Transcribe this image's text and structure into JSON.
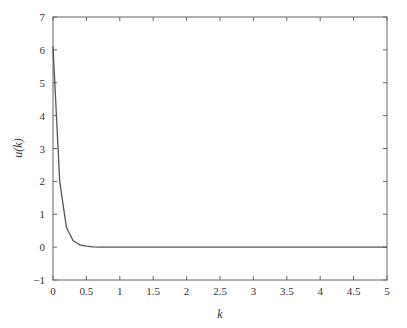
{
  "chart_data": {
    "type": "line",
    "title": "",
    "xlabel": "k",
    "ylabel": "u(k)",
    "xlim": [
      0,
      5
    ],
    "ylim": [
      -1,
      7
    ],
    "grid": false,
    "legend": null,
    "x_ticks": [
      0,
      0.5,
      1,
      1.5,
      2,
      2.5,
      3,
      3.5,
      4,
      4.5,
      5
    ],
    "x_tick_labels": [
      "0",
      "0.5",
      "1",
      "1.5",
      "2",
      "2.5",
      "3",
      "3.5",
      "4",
      "4.5",
      "5"
    ],
    "y_ticks": [
      -1,
      0,
      1,
      2,
      3,
      4,
      5,
      6,
      7
    ],
    "y_tick_labels": [
      "−1",
      "0",
      "1",
      "2",
      "3",
      "4",
      "5",
      "6",
      "7"
    ],
    "series": [
      {
        "name": "u(k)",
        "color": "#555555",
        "x": [
          0,
          0.1,
          0.2,
          0.3,
          0.4,
          0.5,
          0.6,
          0.7,
          0.8,
          1.0,
          1.5,
          2.0,
          2.5,
          3.0,
          3.5,
          4.0,
          4.5,
          5.0
        ],
        "values": [
          6.1,
          2.0,
          0.6,
          0.2,
          0.07,
          0.03,
          0.01,
          0.0,
          0.0,
          0.0,
          0.0,
          0.0,
          0.0,
          0.0,
          0.0,
          0.0,
          0.0,
          0.0
        ]
      }
    ]
  },
  "colors": {
    "axis": "#666666",
    "line": "#555555",
    "text": "#333333"
  }
}
